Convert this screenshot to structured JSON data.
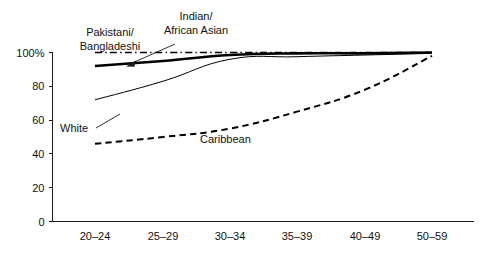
{
  "chart_data": {
    "type": "line",
    "title": "",
    "subtitle": "",
    "xlabel": "",
    "ylabel": "",
    "categories": [
      "20–24",
      "25–29",
      "30–34",
      "35–39",
      "40–49",
      "50–59"
    ],
    "x_tick_labels": [
      "20–24",
      "25–29",
      "30–34",
      "35–39",
      "40–49",
      "50–59"
    ],
    "y_tick_labels": [
      "0",
      "20",
      "40",
      "60",
      "80",
      "100%"
    ],
    "y_tick_values": [
      0,
      20,
      40,
      60,
      80,
      100
    ],
    "ylim": [
      0,
      100
    ],
    "grid": false,
    "legend_position": "inline-annotations",
    "series": [
      {
        "name": "Pakistani/Bangladeshi",
        "style": "dash-dot",
        "width": 1.6,
        "values": [
          100,
          100,
          100,
          100,
          100,
          100
        ]
      },
      {
        "name": "Indian/African Asian",
        "style": "solid-bold",
        "width": 2.6,
        "values": [
          92,
          95,
          98.5,
          99.5,
          99.5,
          100
        ]
      },
      {
        "name": "White",
        "style": "solid-thin",
        "width": 1.0,
        "values": [
          72,
          83,
          96,
          97.5,
          98.5,
          99.5
        ]
      },
      {
        "name": "Caribbean",
        "style": "dashed",
        "width": 2.0,
        "values": [
          46,
          50,
          55,
          65,
          78,
          98
        ]
      }
    ],
    "annotations": [
      {
        "id": "pakistani-bangladeshi-label",
        "lines": [
          "Pakistani/",
          "Bangladeshi"
        ],
        "anchor": "middle",
        "x": 110,
        "y": 36
      },
      {
        "id": "indian-african-asian-label",
        "lines": [
          "Indian/",
          "African Asian"
        ],
        "anchor": "middle",
        "x": 196,
        "y": 20
      },
      {
        "id": "white-label",
        "lines": [
          "White"
        ],
        "anchor": "start",
        "x": 60,
        "y": 132
      },
      {
        "id": "caribbean-label",
        "lines": [
          "Caribbean"
        ],
        "anchor": "start",
        "x": 200,
        "y": 143
      }
    ]
  }
}
